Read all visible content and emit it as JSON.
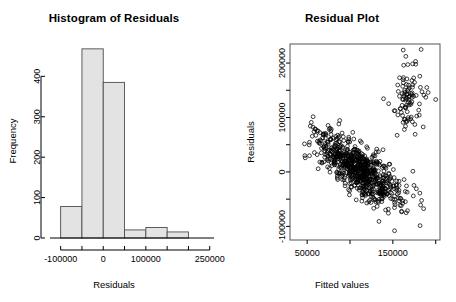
{
  "figure": {
    "background": "#ffffff",
    "panels": [
      "histogram",
      "residual-scatter"
    ]
  },
  "chart_data": [
    {
      "type": "bar",
      "id": "histogram-of-residuals",
      "title": "Histogram of Residuals",
      "xlabel": "Residuals",
      "ylabel": "Frequency",
      "categories": [
        "-100000",
        "-50000",
        "0",
        "50000",
        "100000",
        "150000"
      ],
      "bin_edges": [
        -100000,
        -50000,
        0,
        50000,
        100000,
        150000,
        200000
      ],
      "values": [
        78,
        468,
        385,
        20,
        26,
        15
      ],
      "xlim": [
        -125000,
        260000
      ],
      "ylim": [
        0,
        480
      ],
      "xticks": [
        -100000,
        -50000,
        0,
        50000,
        100000,
        150000,
        200000,
        250000
      ],
      "xtick_labels": [
        "-100000",
        "",
        "0",
        "",
        "100000",
        "",
        "",
        "250000"
      ],
      "yticks": [
        0,
        100,
        200,
        300,
        400
      ],
      "ytick_labels": [
        "0",
        "100",
        "200",
        "300",
        "400"
      ],
      "bar_fill": "#e3e3e3",
      "bar_border": "#4d4d4d",
      "grid": false,
      "legend": "none"
    },
    {
      "type": "scatter",
      "id": "residual-plot",
      "title": "Residual Plot",
      "xlabel": "Fitted values",
      "ylabel": "Residuals",
      "xlim": [
        30000,
        205000
      ],
      "ylim": [
        -125000,
        235000
      ],
      "xticks": [
        50000,
        100000,
        150000,
        200000
      ],
      "xtick_labels": [
        "50000",
        "",
        "150000",
        ""
      ],
      "yticks": [
        -100000,
        -50000,
        0,
        50000,
        100000,
        150000,
        200000
      ],
      "ytick_labels": [
        "-100000",
        "",
        "0",
        "",
        "100000",
        "",
        "200000"
      ],
      "marker": "open-circle",
      "marker_color": "#000000",
      "grid": false,
      "legend": "none",
      "clusters": [
        {
          "name": "main-cloud",
          "description": "dense negatively sloped band",
          "n": 760,
          "x_center": 110000,
          "y_center": 5000,
          "slope": -1.05,
          "x_spread": 26000,
          "y_spread": 22000
        },
        {
          "name": "upper-right-cluster",
          "description": "separate high-residual group",
          "n": 95,
          "x_center": 168000,
          "y_center": 140000,
          "slope": 1.1,
          "x_spread": 9000,
          "y_spread": 36000
        }
      ],
      "outliers": [
        {
          "x": 183000,
          "y": 225000
        },
        {
          "x": 200000,
          "y": 133000
        },
        {
          "x": 87000,
          "y": 88000
        },
        {
          "x": 152000,
          "y": -108000
        }
      ]
    }
  ]
}
